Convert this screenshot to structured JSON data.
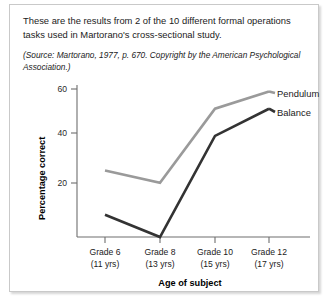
{
  "caption": {
    "main": "These are the results from 2 of the 10 different formal operations tasks used in Martorano's cross-sectional study.",
    "source": "(Source: Martorano, 1977, p. 670. Copyright by the American Psychological Association.)"
  },
  "chart_data": {
    "type": "line",
    "title": "",
    "xlabel": "Age of subject",
    "ylabel": "Percentage correct",
    "categories": [
      "Grade 6",
      "Grade 8",
      "Grade 10",
      "Grade 12"
    ],
    "category_sublabels": [
      "(11 yrs)",
      "(13 yrs)",
      "(15 yrs)",
      "(17 yrs)"
    ],
    "yticks": [
      20,
      40,
      60
    ],
    "ytick_labels": [
      "20",
      "40",
      "60"
    ],
    "ylim": [
      0,
      64
    ],
    "grid": false,
    "legend_position": "right-inline",
    "series": [
      {
        "name": "Pendulum",
        "color": "#9a9a9a",
        "values": [
          27,
          22,
          52,
          59
        ]
      },
      {
        "name": "Balance",
        "color": "#333333",
        "values": [
          9,
          0,
          41,
          52
        ]
      }
    ]
  }
}
